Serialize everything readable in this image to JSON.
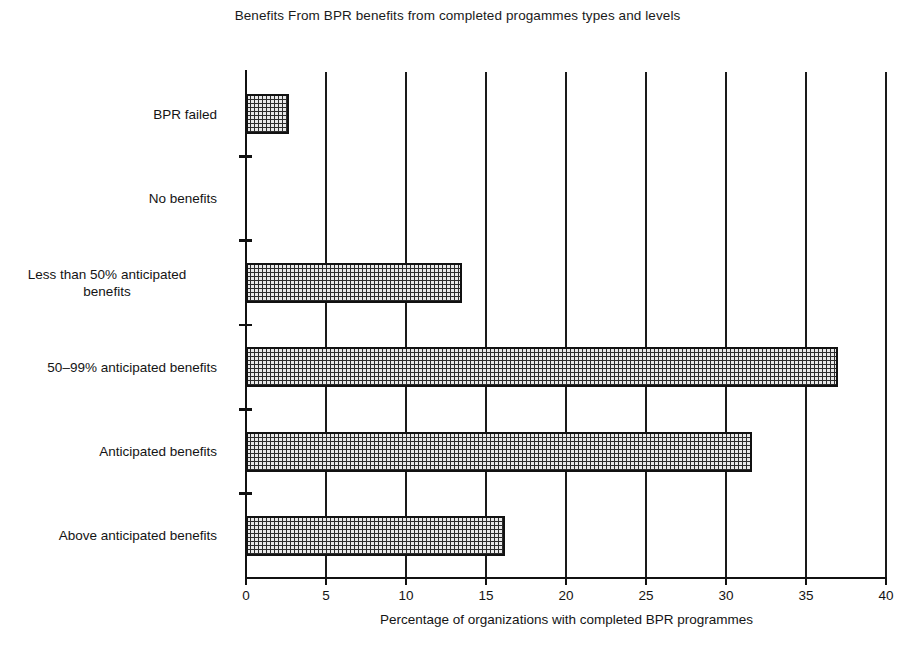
{
  "chart": {
    "title": "Benefits From BPR benefits from completed progammes types and levels",
    "xlabel": "Percentage of organizations with completed BPR programmes",
    "ylabel": ""
  },
  "chart_data": {
    "type": "bar",
    "orientation": "horizontal",
    "title": "Benefits From BPR benefits from completed progammes types and levels",
    "xlabel": "Percentage of organizations with completed BPR programmes",
    "ylabel": "",
    "categories": [
      "BPR failed",
      "No benefits",
      "Less than 50% anticipated benefits",
      "50–99% anticipated benefits",
      "Anticipated benefits",
      "Above anticipated benefits"
    ],
    "category_lines": [
      [
        "BPR failed"
      ],
      [
        "No benefits"
      ],
      [
        "Less than 50% anticipated",
        "benefits"
      ],
      [
        "50–99% anticipated benefits"
      ],
      [
        "Anticipated benefits"
      ],
      [
        "Above anticipated benefits"
      ]
    ],
    "values": [
      2.7,
      0,
      13.5,
      37.0,
      31.6,
      16.2
    ],
    "xlim": [
      0,
      40
    ],
    "xticks": [
      0,
      5,
      10,
      15,
      20,
      25,
      30,
      35,
      40
    ],
    "xtick_labels": [
      "0",
      "5",
      "10",
      "15",
      "20",
      "25",
      "30",
      "35",
      "40"
    ],
    "grid": "vertical",
    "legend": "none",
    "bar_fill": "#e8e8e8",
    "bar_edge": "#111111",
    "axis_color": "#111111"
  }
}
